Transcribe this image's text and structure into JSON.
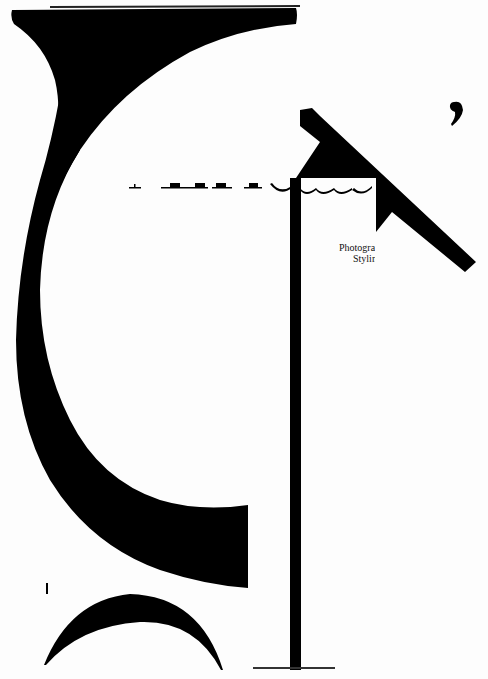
{
  "page": {
    "background": "#ffffff",
    "ink_color": "#000000"
  },
  "glyphs": {
    "large_letter_left": "G",
    "large_letter_right": "T",
    "bottom_arc": "(",
    "small_mark": "I",
    "comma": ","
  },
  "headline": {
    "visible_fragment": "Africa",
    "note": "only letter baselines visible"
  },
  "credits": {
    "line1": "Photogra",
    "line2": "Stylin"
  }
}
